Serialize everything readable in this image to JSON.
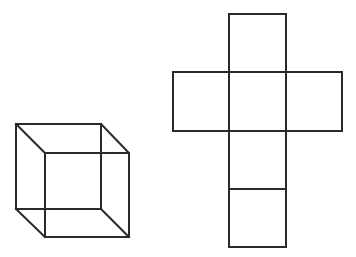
{
  "figure": {
    "stroke_color": "#2a2a2a",
    "background": "#ffffff"
  },
  "cube": {
    "back_face": {
      "x": 16,
      "y": 124,
      "size": 85
    },
    "front_face": {
      "x": 45,
      "y": 153,
      "size": 84
    }
  },
  "net": {
    "columns_x": [
      173,
      229,
      286,
      342
    ],
    "rows_y": [
      14,
      72,
      131,
      189,
      247
    ],
    "faces": [
      {
        "name": "top",
        "col": 1,
        "row": 0
      },
      {
        "name": "left",
        "col": 0,
        "row": 1
      },
      {
        "name": "front",
        "col": 1,
        "row": 1
      },
      {
        "name": "right",
        "col": 2,
        "row": 1
      },
      {
        "name": "bottom",
        "col": 1,
        "row": 2
      },
      {
        "name": "back",
        "col": 1,
        "row": 3
      }
    ]
  }
}
